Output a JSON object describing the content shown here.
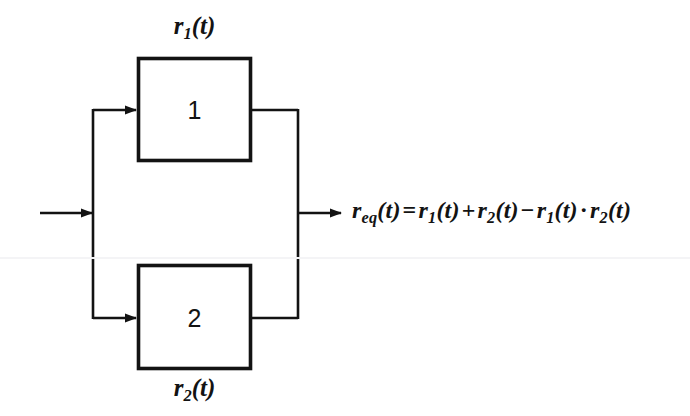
{
  "diagram": {
    "type": "reliability-block-diagram",
    "stroke_color": "#131313",
    "background_color": "#ffffff",
    "blocks": [
      {
        "id": "block-1",
        "number": "1",
        "label": "r₁(t)",
        "label_position": "above",
        "label_base": "r",
        "label_sub": "1",
        "label_arg": "(t)",
        "x": 137,
        "y": 57,
        "width": 115,
        "height": 105
      },
      {
        "id": "block-2",
        "number": "2",
        "label": "r₂(t)",
        "label_position": "below",
        "label_base": "r",
        "label_sub": "2",
        "label_arg": "(t)",
        "x": 137,
        "y": 264,
        "width": 115,
        "height": 106
      }
    ],
    "connections": {
      "input_arrow": {
        "name": "system-input",
        "from_x": 40,
        "to_x": 93,
        "y": 213
      },
      "split_bus_x": 93,
      "split_top_y": 110,
      "split_bottom_y": 318,
      "merge_bus_x": 298,
      "output_arrow": {
        "name": "system-output",
        "from_x": 298,
        "to_x": 342,
        "y": 213
      }
    },
    "equation": {
      "full_text": "r_eq(t) = r₁(t) + r₂(t) − r₁(t) · r₂(t)",
      "lhs_base": "r",
      "lhs_sub": "eq",
      "lhs_arg": "(t)",
      "equals": "=",
      "term1_base": "r",
      "term1_sub": "1",
      "term1_arg": "(t)",
      "plus": "+",
      "term2_base": "r",
      "term2_sub": "2",
      "term2_arg": "(t)",
      "minus": "−",
      "term3_base": "r",
      "term3_sub": "1",
      "term3_arg": "(t)",
      "times": "·",
      "term4_base": "r",
      "term4_sub": "2",
      "term4_arg": "(t)"
    }
  }
}
